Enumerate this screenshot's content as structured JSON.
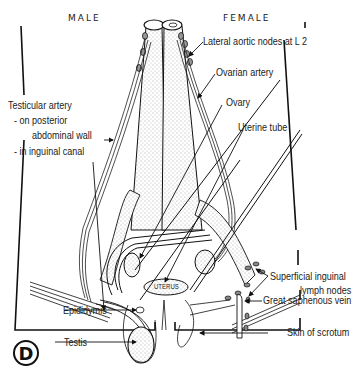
{
  "figure": {
    "panel_letter": "D",
    "headers": {
      "male": "MALE",
      "female": "FEMALE"
    },
    "labels": {
      "lateral_aortic_nodes": "Lateral aortic nodes at L 2",
      "ovarian_artery": "Ovarian artery",
      "ovary": "Ovary",
      "uterine_tube": "Uterine tube",
      "uterus": "UTERUS",
      "testicular_artery": "Testicular artery",
      "on_posterior": "- on posterior",
      "abdominal_wall": "abdominal wall",
      "in_inguinal_canal": "- in inguinal canal",
      "superficial_inguinal_1": "Superficial inguinal",
      "superficial_inguinal_2": "lymph nodes",
      "great_saphenous_vein": "Great saphenous vein",
      "epididymis": "Epididymis",
      "testis": "Testis",
      "skin_of_scrotum": "Skin of scrotum"
    }
  }
}
